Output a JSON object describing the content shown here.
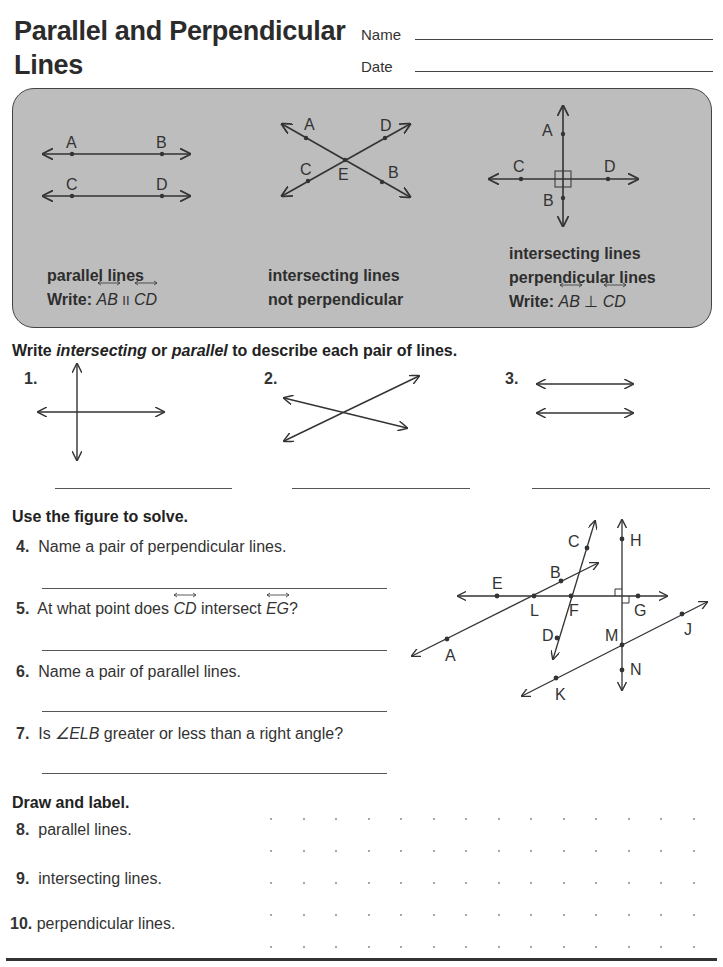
{
  "header": {
    "title_line1": "Parallel and Perpendicular",
    "title_line2": "Lines",
    "name_label": "Name",
    "date_label": "Date"
  },
  "panel": {
    "parallel": {
      "points": [
        "A",
        "B",
        "C",
        "D"
      ],
      "caption": "parallel lines",
      "write_prefix": "Write:",
      "line1": "AB",
      "symbol": "II",
      "line2": "CD"
    },
    "intersecting": {
      "points": [
        "A",
        "D",
        "C",
        "E",
        "B"
      ],
      "caption_line1": "intersecting lines",
      "caption_line2": "not perpendicular"
    },
    "perpendicular": {
      "points": [
        "A",
        "C",
        "D",
        "B"
      ],
      "caption_line1": "intersecting lines",
      "caption_line2": "perpendicular lines",
      "write_prefix": "Write:",
      "line1": "AB",
      "symbol": "⊥",
      "line2": "CD"
    }
  },
  "section1": {
    "instruction_pre": "Write ",
    "instruction_word1": "intersecting",
    "instruction_mid": " or ",
    "instruction_word2": "parallel",
    "instruction_post": " to describe each pair of lines.",
    "items": [
      {
        "num": "1.",
        "figure": "perpendicular-cross"
      },
      {
        "num": "2.",
        "figure": "crossing-lines"
      },
      {
        "num": "3.",
        "figure": "parallel-lines"
      }
    ]
  },
  "section2": {
    "instruction": "Use the figure to solve.",
    "questions": [
      {
        "num": "4.",
        "text": "Name a  pair of perpendicular lines."
      },
      {
        "num": "5.",
        "text_pre": "At what point does ",
        "line1": "CD",
        "text_mid": " intersect ",
        "line2": "EG",
        "text_post": "?"
      },
      {
        "num": "6.",
        "text": "Name a pair of parallel lines."
      },
      {
        "num": "7.",
        "text_pre": "Is ",
        "angle": "∠ELB",
        "text_post": " greater or less than a right angle?"
      }
    ],
    "figure_points": [
      "C",
      "H",
      "B",
      "E",
      "L",
      "F",
      "G",
      "D",
      "M",
      "J",
      "A",
      "N",
      "K"
    ]
  },
  "section3": {
    "instruction": "Draw and label.",
    "items": [
      {
        "num": "8.",
        "text": "parallel lines."
      },
      {
        "num": "9.",
        "text": "intersecting lines."
      },
      {
        "num": "10.",
        "text": "perpendicular lines."
      }
    ],
    "dot_grid": {
      "rows": 5,
      "cols": 14
    }
  }
}
